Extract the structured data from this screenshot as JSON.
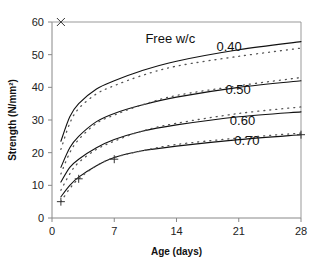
{
  "chart_data": {
    "type": "line",
    "title": "",
    "xlabel": "Age (days)",
    "ylabel": "Strength (N/mm²)",
    "xlim": [
      0,
      28
    ],
    "ylim": [
      0,
      60
    ],
    "xticks": [
      0,
      7,
      14,
      21,
      28
    ],
    "yticks": [
      0,
      10,
      20,
      30,
      40,
      50,
      60
    ],
    "grid": false,
    "legend_title": "Free w/c",
    "x": [
      1,
      2,
      3,
      5,
      7,
      10,
      14,
      21,
      28
    ],
    "series": [
      {
        "name": "0.40",
        "style": "solid",
        "values": [
          23.5,
          31,
          35,
          39.5,
          42,
          45,
          48,
          51.5,
          54
        ]
      },
      {
        "name": "0.40 (dotted)",
        "style": "dotted",
        "values": [
          21,
          29,
          33.5,
          38,
          40.5,
          43.5,
          46.5,
          49.5,
          52
        ]
      },
      {
        "name": "0.50",
        "style": "solid",
        "values": [
          15.5,
          21.5,
          25,
          29.5,
          32,
          34.5,
          37,
          40,
          42
        ]
      },
      {
        "name": "0.50 (dotted)",
        "style": "dotted",
        "values": [
          13.5,
          20,
          24,
          29,
          31.5,
          34.5,
          37.5,
          40.5,
          43
        ]
      },
      {
        "name": "0.60",
        "style": "solid",
        "values": [
          11,
          15.5,
          18,
          21.5,
          24,
          26.5,
          28.5,
          31,
          32.5
        ]
      },
      {
        "name": "0.60 (dotted)",
        "style": "dotted",
        "values": [
          8.5,
          13.5,
          17,
          21,
          23.5,
          26.5,
          29,
          32,
          34
        ]
      },
      {
        "name": "0.70",
        "style": "solid",
        "values": [
          6.5,
          10,
          12.5,
          16,
          18.5,
          20.5,
          22,
          24,
          25.5
        ]
      },
      {
        "name": "0.70 (dotted)",
        "style": "dotted",
        "values": [
          5,
          9,
          12,
          16,
          18.5,
          20.5,
          22.5,
          24.5,
          26
        ]
      }
    ],
    "markers": [
      {
        "symbol": "x",
        "x": 1,
        "y": 60
      },
      {
        "symbol": "+",
        "x": 1,
        "y": 5
      },
      {
        "symbol": "+",
        "x": 3,
        "y": 12
      },
      {
        "symbol": "+",
        "x": 7,
        "y": 18
      },
      {
        "symbol": "+",
        "x": 28,
        "y": 25.5
      }
    ],
    "annotations": [
      {
        "text": "Free w/c",
        "x": 10.5,
        "y": 53.5
      },
      {
        "text": "0.40",
        "x": 18.5,
        "y": 51
      },
      {
        "text": "0.50",
        "x": 19.5,
        "y": 38
      },
      {
        "text": "0.60",
        "x": 20,
        "y": 28.5
      },
      {
        "text": "0.70",
        "x": 20.5,
        "y": 22.5
      }
    ],
    "legend_position": "none"
  }
}
